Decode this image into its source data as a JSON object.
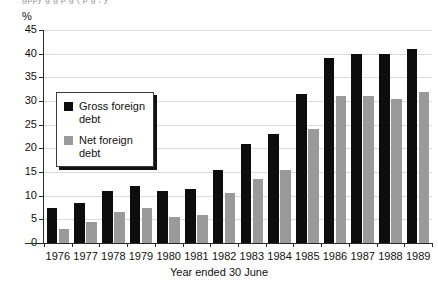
{
  "chart_data": {
    "type": "bar",
    "title": "",
    "title_clipped_remnant": "gppy   g    g     p   g     ( p     g  ,  y",
    "xlabel": "Year ended 30 June",
    "ylabel": "%",
    "unit": "%",
    "categories": [
      "1976",
      "1977",
      "1978",
      "1979",
      "1980",
      "1981",
      "1982",
      "1983",
      "1984",
      "1985",
      "1986",
      "1987",
      "1988",
      "1989"
    ],
    "series": [
      {
        "name": "Gross foreign debt",
        "color": "#0d0d0d",
        "values": [
          7.5,
          8.5,
          11.0,
          12.0,
          11.0,
          11.5,
          15.5,
          21.0,
          23.0,
          31.5,
          39.0,
          40.0,
          40.0,
          41.0
        ]
      },
      {
        "name": "Net foreign debt",
        "color": "#9a9a9a",
        "values": [
          3.0,
          4.5,
          6.5,
          7.5,
          5.5,
          6.0,
          10.5,
          13.5,
          15.5,
          24.0,
          31.0,
          31.0,
          30.5,
          32.0
        ]
      }
    ],
    "ylim": [
      0,
      45
    ],
    "yticks": [
      0,
      5,
      10,
      15,
      20,
      25,
      30,
      35,
      40,
      45
    ],
    "grid": true,
    "legend_position": "inside-left"
  },
  "legend": {
    "items": [
      {
        "label": "Gross foreign debt",
        "color": "#0d0d0d"
      },
      {
        "label": "Net foreign debt",
        "color": "#9a9a9a"
      }
    ]
  }
}
